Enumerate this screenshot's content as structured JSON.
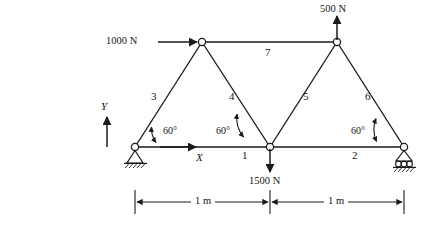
{
  "figure": {
    "type": "truss-free-body-diagram",
    "stroke_color": "#1a1a1a",
    "text_color": "#141414"
  },
  "loads": [
    {
      "id": "load-1000n",
      "label": "1000 N",
      "magnitude": 1000,
      "unit": "N",
      "direction": "right",
      "applied_at": "left-apex-node"
    },
    {
      "id": "load-500n",
      "label": "500 N",
      "magnitude": 500,
      "unit": "N",
      "direction": "up",
      "applied_at": "right-apex-node"
    },
    {
      "id": "load-1500n",
      "label": "1500 N",
      "magnitude": 1500,
      "unit": "N",
      "direction": "down",
      "applied_at": "middle-bottom-node"
    }
  ],
  "members": [
    {
      "id": "member-1",
      "label": "1",
      "from": "left-support-node",
      "to": "middle-bottom-node"
    },
    {
      "id": "member-2",
      "label": "2",
      "from": "middle-bottom-node",
      "to": "right-support-node"
    },
    {
      "id": "member-3",
      "label": "3",
      "from": "left-support-node",
      "to": "left-apex-node"
    },
    {
      "id": "member-4",
      "label": "4",
      "from": "left-apex-node",
      "to": "middle-bottom-node"
    },
    {
      "id": "member-5",
      "label": "5",
      "from": "middle-bottom-node",
      "to": "right-apex-node"
    },
    {
      "id": "member-6",
      "label": "6",
      "from": "right-apex-node",
      "to": "right-support-node"
    },
    {
      "id": "member-7",
      "label": "7",
      "from": "left-apex-node",
      "to": "right-apex-node"
    }
  ],
  "angles": [
    {
      "id": "angle-left",
      "label": "60°",
      "value": 60,
      "unit": "deg",
      "at": "left-support-node"
    },
    {
      "id": "angle-middle",
      "label": "60°",
      "value": 60,
      "unit": "deg",
      "at": "middle-bottom-node"
    },
    {
      "id": "angle-right",
      "label": "60°",
      "value": 60,
      "unit": "deg",
      "at": "right-support-node"
    }
  ],
  "axes": [
    {
      "id": "axis-y",
      "label": "Y",
      "direction": "up"
    },
    {
      "id": "axis-x",
      "label": "X",
      "direction": "right"
    }
  ],
  "dimensions": [
    {
      "id": "dim-left",
      "label": "1 m",
      "value": 1,
      "unit": "m",
      "span": "left-support-node to middle-bottom-node"
    },
    {
      "id": "dim-right",
      "label": "1 m",
      "value": 1,
      "unit": "m",
      "span": "middle-bottom-node to right-support-node"
    }
  ],
  "supports": [
    {
      "id": "support-left",
      "type": "pinned",
      "at": "left-support-node"
    },
    {
      "id": "support-right",
      "type": "roller",
      "at": "right-support-node"
    }
  ],
  "nodes": [
    {
      "id": "left-support-node",
      "x": 135,
      "y": 147
    },
    {
      "id": "middle-bottom-node",
      "x": 270,
      "y": 147
    },
    {
      "id": "right-support-node",
      "x": 404,
      "y": 147
    },
    {
      "id": "left-apex-node",
      "x": 202,
      "y": 42
    },
    {
      "id": "right-apex-node",
      "x": 337,
      "y": 42
    }
  ]
}
